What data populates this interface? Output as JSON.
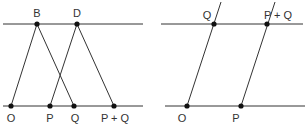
{
  "left_diagram": {
    "top_line": {
      "x1": 3,
      "x2": 143,
      "y": 24
    },
    "bottom_line": {
      "x1": 3,
      "x2": 143,
      "y": 106
    },
    "points": [
      {
        "id": "B",
        "label": "B",
        "x": 37,
        "y": 24,
        "lx": 37,
        "ly": 17
      },
      {
        "id": "D",
        "label": "D",
        "x": 77,
        "y": 24,
        "lx": 77,
        "ly": 17
      },
      {
        "id": "O",
        "label": "O",
        "x": 11,
        "y": 106,
        "lx": 11,
        "ly": 122
      },
      {
        "id": "P",
        "label": "P",
        "x": 50,
        "y": 106,
        "lx": 50,
        "ly": 122
      },
      {
        "id": "Q",
        "label": "Q",
        "x": 74,
        "y": 106,
        "lx": 75,
        "ly": 122
      },
      {
        "id": "PQ",
        "label": "P + Q",
        "x": 114,
        "y": 106,
        "lx": 115,
        "ly": 122
      }
    ],
    "segments": [
      {
        "from": "O",
        "to": "B"
      },
      {
        "from": "B",
        "to": "Q"
      },
      {
        "from": "P",
        "to": "D"
      },
      {
        "from": "D",
        "to": "PQ"
      }
    ]
  },
  "right_diagram": {
    "top_line": {
      "x1": 161,
      "x2": 303,
      "y": 24
    },
    "bottom_line": {
      "x1": 165,
      "x2": 305,
      "y": 106
    },
    "points": [
      {
        "id": "Q",
        "label": "Q",
        "x": 214,
        "y": 24,
        "lx": 207,
        "ly": 19
      },
      {
        "id": "PQ",
        "label": "P + Q",
        "x": 267,
        "y": 24,
        "lx": 278,
        "ly": 19
      },
      {
        "id": "O",
        "label": "O",
        "x": 187,
        "y": 106,
        "lx": 182,
        "ly": 122
      },
      {
        "id": "P",
        "label": "P",
        "x": 241,
        "y": 106,
        "lx": 236,
        "ly": 122
      }
    ],
    "lines": [
      {
        "x1": 187,
        "y1": 106,
        "x2": 221,
        "y2": 2
      },
      {
        "x1": 241,
        "y1": 106,
        "x2": 275,
        "y2": 2
      }
    ]
  }
}
